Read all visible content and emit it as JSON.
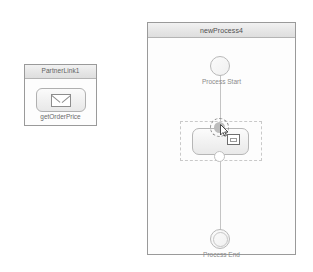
{
  "canvas": {
    "background_color": "#ffffff"
  },
  "partner_link_panel": {
    "title": "PartnerLink1",
    "operation": {
      "label": "getOrderPrice",
      "icon": "envelope-icon"
    }
  },
  "process_panel": {
    "title": "newProcess4",
    "nodes": {
      "start": {
        "label": "Process Start",
        "shape": "circle"
      },
      "activity": {
        "label": "",
        "state": "selected",
        "shape": "rounded-rectangle"
      },
      "end": {
        "label": "Process End",
        "shape": "double-circle"
      }
    }
  },
  "pointer": {
    "state": "dragging",
    "cursor": "arrow-cursor",
    "drop_indicator": "drop-badge"
  },
  "colors": {
    "panel_border": "#9a9a9a",
    "header_gradient_top": "#f2f2f2",
    "header_gradient_bottom": "#dedede",
    "node_border": "#b8b8b8",
    "label_text": "#8a8a8a",
    "connector": "#c4c4c4",
    "selection_dash": "#c9c9c9"
  }
}
